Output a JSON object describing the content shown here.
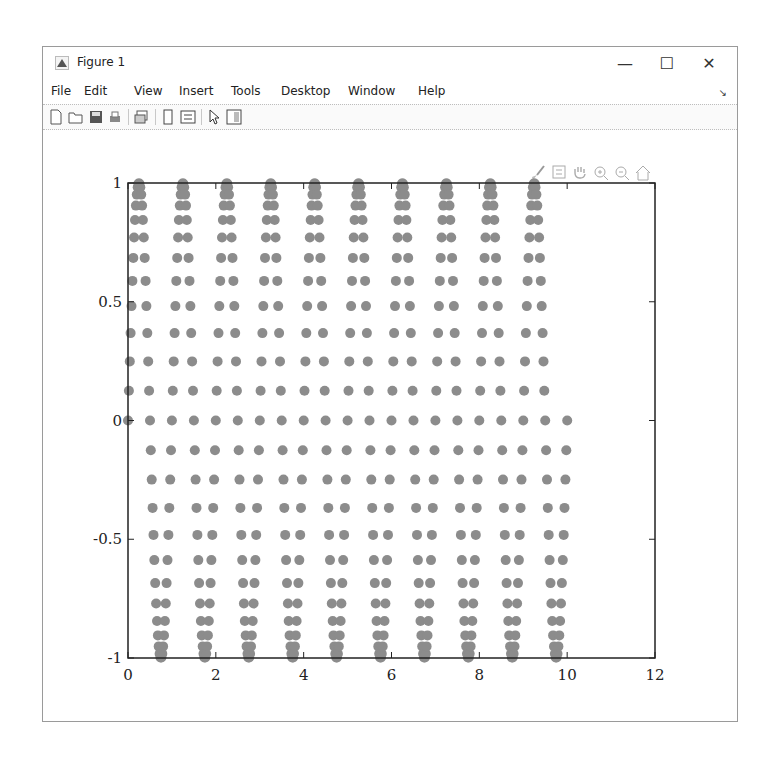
{
  "window": {
    "title": "Figure 1",
    "controls": {
      "minimize": "—",
      "maximize": "☐",
      "close": "✕"
    }
  },
  "menubar": {
    "items": [
      "File",
      "Edit",
      "View",
      "Insert",
      "Tools",
      "Desktop",
      "Window",
      "Help"
    ],
    "dock_arrow": "↘"
  },
  "toolbar": {
    "icons": [
      "new-figure-icon",
      "open-file-icon",
      "save-icon",
      "print-icon",
      "link-plot-icon",
      "hide-plot-tools-icon",
      "show-plot-tools-icon",
      "edit-plot-arrow-icon",
      "property-inspector-icon"
    ]
  },
  "axes_toolbar": {
    "icons": [
      "brush-icon",
      "data-tips-icon",
      "pan-hand-icon",
      "zoom-in-icon",
      "zoom-out-icon",
      "restore-view-home-icon"
    ]
  },
  "colors": {
    "marker": "#8c8c8c",
    "axis": "#222222"
  },
  "chart_data": {
    "type": "scatter",
    "title": "",
    "xlabel": "",
    "ylabel": "",
    "xlim": [
      0,
      12
    ],
    "ylim": [
      -1,
      1
    ],
    "xticks": [
      0,
      2,
      4,
      6,
      8,
      10,
      12
    ],
    "yticks": [
      -1,
      -0.5,
      0,
      0.5,
      1
    ],
    "xtick_labels": [
      "0",
      "2",
      "4",
      "6",
      "8",
      "10",
      "12"
    ],
    "ytick_labels": [
      "-1",
      "-0.5",
      "0",
      "0.5",
      "1"
    ],
    "grid": false,
    "legend": null,
    "x_start": 0,
    "x_step": 0.02,
    "one_period_values": [
      0,
      0.1253,
      0.2487,
      0.3681,
      0.4818,
      0.5878,
      0.6845,
      0.7705,
      0.8443,
      0.9048,
      0.9511,
      0.9823,
      0.998,
      0.998,
      0.9823,
      0.9511,
      0.9048,
      0.8443,
      0.7705,
      0.6845,
      0.5878,
      0.4818,
      0.3681,
      0.2487,
      0.1253,
      0,
      -0.1253,
      -0.2487,
      -0.3681,
      -0.4818,
      -0.5878,
      -0.6845,
      -0.7705,
      -0.8443,
      -0.9048,
      -0.9511,
      -0.9823,
      -0.998,
      -0.998,
      -0.9823,
      -0.9511,
      -0.9048,
      -0.8443,
      -0.7705,
      -0.6845,
      -0.5878,
      -0.4818,
      -0.3681,
      -0.2487,
      -0.1253
    ],
    "periods": 10,
    "x_end": 10
  }
}
